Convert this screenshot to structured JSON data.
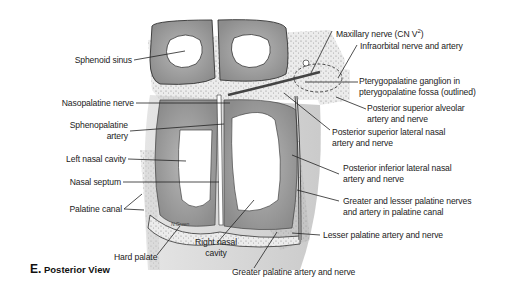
{
  "figure": {
    "caption_letter": "E.",
    "caption_text": "Posterior View",
    "signature": "N.Green"
  },
  "labels": {
    "sphenoid_sinus": "Sphenoid sinus",
    "nasopalatine_nerve": "Nasopalatine nerve",
    "sphenopalatine_artery_1": "Sphenopalatine",
    "sphenopalatine_artery_2": "artery",
    "left_nasal_cavity": "Left nasal cavity",
    "nasal_septum": "Nasal septum",
    "palatine_canal": "Palatine canal",
    "hard_palate": "Hard palate",
    "right_nasal_cavity_1": "Right nasal",
    "right_nasal_cavity_2": "cavity",
    "greater_palatine": "Greater palatine artery and nerve",
    "maxillary_nerve": "Maxillary nerve (CN V",
    "maxillary_sup": "2",
    "maxillary_close": ")",
    "infraorbital": "Infraorbital nerve and artery",
    "pterygopalatine_1": "Pterygopalatine ganglion in",
    "pterygopalatine_2": "pterygopalatine fossa (outlined)",
    "post_sup_alveolar_1": "Posterior superior alveolar",
    "post_sup_alveolar_2": "artery and nerve",
    "post_sup_lateral_1": "Posterior superior lateral nasal",
    "post_sup_lateral_2": "artery and nerve",
    "post_inf_lateral_1": "Posterior inferior lateral nasal",
    "post_inf_lateral_2": "artery and nerve",
    "greater_lesser_1": "Greater and lesser palatine nerves",
    "greater_lesser_2": "and artery in palatine canal",
    "lesser_palatine": "Lesser palatine artery and nerve"
  },
  "colors": {
    "bone": "#9a9a9a",
    "bone_light": "#c8c8c8",
    "cavity": "#ffffff",
    "line": "#222222",
    "stipple": "#e6e6e6"
  }
}
